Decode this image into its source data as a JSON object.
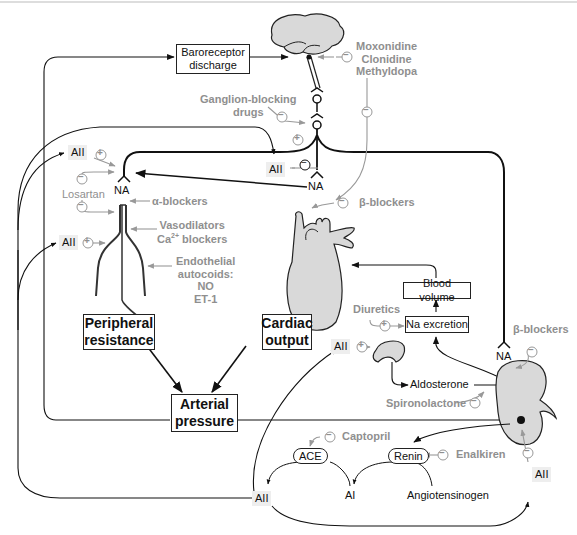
{
  "diagram": {
    "type": "physiology-flow"
  },
  "colors": {
    "line": "#111111",
    "drug_text": "#8f8f8f",
    "organ_fill": "#d9d9d9",
    "aii_background": "#eeeeee"
  },
  "nodes": {
    "baroreceptor": "Baroreceptor discharge",
    "peripheral_resistance": "Peripheral resistance",
    "cardiac_output": "Cardiac output",
    "arterial_pressure": "Arterial pressure",
    "blood_volume": "Blood volume",
    "na_excretion": "Na excretion",
    "aldosterone": "Aldosterone",
    "ace": "ACE",
    "renin": "Renin",
    "ai": "AI",
    "angiotensinogen": "Angiotensinogen",
    "na_vessel": "NA",
    "na_heart": "NA",
    "na_kidney": "NA",
    "aii_labels": [
      "AII",
      "AII",
      "AII",
      "AII",
      "AII",
      "AII"
    ]
  },
  "drugs": {
    "central": [
      "Moxonidine",
      "Clonidine",
      "Methyldopa"
    ],
    "ganglion_line1": "Ganglion-blocking",
    "ganglion_line2": "drugs",
    "losartan": "Losartan",
    "alpha_blockers": "α-blockers",
    "vasodilators": "Vasodilators",
    "ca_blockers_prefix": "Ca",
    "ca_blockers_sup": "2+",
    "ca_blockers_suffix": " blockers",
    "endothelial": [
      "Endothelial",
      "autocoids:",
      "NO",
      "ET-1"
    ],
    "beta_blockers_heart": "β-blockers",
    "beta_blockers_kidney": "β-blockers",
    "diuretics": "Diuretics",
    "spironolactone": "Spironolactone",
    "captopril": "Captopril",
    "enalkiren": "Enalkiren"
  },
  "signs": {
    "plus": "+",
    "minus": "−"
  }
}
